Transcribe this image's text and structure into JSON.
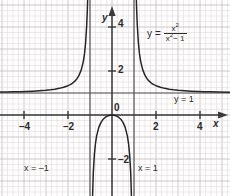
{
  "chart_data": {
    "type": "line",
    "title": "",
    "equation_label": "y = x²/(x² − 1)",
    "equation_parts": {
      "lhs": "y",
      "equals": "=",
      "numerator_base": "x",
      "numerator_exp": "2",
      "denominator_base": "x",
      "denominator_exp": "2",
      "denominator_tail": "− 1"
    },
    "xlabel": "x",
    "ylabel": "y",
    "xlim": [
      -5.1,
      5.4
    ],
    "ylim": [
      -3.6,
      4.9
    ],
    "x_ticks": [
      -4,
      -2,
      2,
      4
    ],
    "x_tick_labels": [
      "–4",
      "–2",
      "2",
      "4"
    ],
    "y_ticks": [
      2,
      4,
      -2
    ],
    "y_tick_labels": [
      "2",
      "4",
      "–2"
    ],
    "origin_label": "0",
    "grid": true,
    "grid_minor_spacing_units": 0.25,
    "grid_major_spacing_units": 1,
    "legend_position": "none",
    "asymptotes": [
      {
        "name": "vertical-left",
        "type": "vertical",
        "value": -1,
        "label": "x = –1"
      },
      {
        "name": "vertical-right",
        "type": "vertical",
        "value": 1,
        "label": "x = 1"
      },
      {
        "name": "horizontal",
        "type": "horizontal",
        "value": 1,
        "label": "y = 1"
      }
    ],
    "series": [
      {
        "name": "left-branch",
        "domain": [
          -5.1,
          -1.02
        ],
        "points": [
          [
            -5.1,
            1.0417
          ],
          [
            -4.8,
            1.0474
          ],
          [
            -4.5,
            1.0541
          ],
          [
            -4.2,
            1.06
          ],
          [
            -3.9,
            1.0701
          ],
          [
            -3.6,
            1.0833
          ],
          [
            -3.3,
            1.1013
          ],
          [
            -3.0,
            1.125
          ],
          [
            -2.8,
            1.1458
          ],
          [
            -2.6,
            1.1733
          ],
          [
            -2.4,
            1.2109
          ],
          [
            -2.2,
            1.2644
          ],
          [
            -2.0,
            1.3333
          ],
          [
            -1.9,
            1.3805
          ],
          [
            -1.8,
            1.4423
          ],
          [
            -1.7,
            1.5263
          ],
          [
            -1.6,
            1.641
          ],
          [
            -1.5,
            1.8
          ],
          [
            -1.4,
            2.0417
          ],
          [
            -1.3,
            2.4493
          ],
          [
            -1.25,
            2.7778
          ],
          [
            -1.2,
            3.2727
          ],
          [
            -1.15,
            4.0698
          ],
          [
            -1.12,
            4.8131
          ],
          [
            -1.1,
            5.4762
          ],
          [
            -1.05,
            10.2561
          ],
          [
            -1.02,
            25.7525
          ]
        ]
      },
      {
        "name": "middle-branch",
        "domain": [
          -0.98,
          0.98
        ],
        "points": [
          [
            -0.98,
            -24.2525
          ],
          [
            -0.95,
            -9.2564
          ],
          [
            -0.9,
            -4.2632
          ],
          [
            -0.85,
            -2.6081
          ],
          [
            -0.8,
            -1.7778
          ],
          [
            -0.75,
            -1.2857
          ],
          [
            -0.7,
            -0.9608
          ],
          [
            -0.6,
            -0.5625
          ],
          [
            -0.5,
            -0.3333
          ],
          [
            -0.4,
            -0.1905
          ],
          [
            -0.3,
            -0.0989
          ],
          [
            -0.2,
            -0.0417
          ],
          [
            -0.1,
            -0.0101
          ],
          [
            0.0,
            0.0
          ],
          [
            0.1,
            -0.0101
          ],
          [
            0.2,
            -0.0417
          ],
          [
            0.3,
            -0.0989
          ],
          [
            0.4,
            -0.1905
          ],
          [
            0.5,
            -0.3333
          ],
          [
            0.6,
            -0.5625
          ],
          [
            0.7,
            -0.9608
          ],
          [
            0.75,
            -1.2857
          ],
          [
            0.8,
            -1.7778
          ],
          [
            0.85,
            -2.6081
          ],
          [
            0.9,
            -4.2632
          ],
          [
            0.95,
            -9.2564
          ],
          [
            0.98,
            -24.2525
          ]
        ]
      },
      {
        "name": "right-branch",
        "domain": [
          1.02,
          5.4
        ],
        "points": [
          [
            1.02,
            25.7525
          ],
          [
            1.05,
            10.2561
          ],
          [
            1.1,
            5.4762
          ],
          [
            1.12,
            4.8131
          ],
          [
            1.15,
            4.0698
          ],
          [
            1.2,
            3.2727
          ],
          [
            1.25,
            2.7778
          ],
          [
            1.3,
            2.4493
          ],
          [
            1.4,
            2.0417
          ],
          [
            1.5,
            1.8
          ],
          [
            1.6,
            1.641
          ],
          [
            1.7,
            1.5263
          ],
          [
            1.8,
            1.4423
          ],
          [
            1.9,
            1.3805
          ],
          [
            2.0,
            1.3333
          ],
          [
            2.2,
            1.2644
          ],
          [
            2.4,
            1.2109
          ],
          [
            2.6,
            1.1733
          ],
          [
            2.8,
            1.1458
          ],
          [
            3.0,
            1.125
          ],
          [
            3.3,
            1.1013
          ],
          [
            3.6,
            1.0833
          ],
          [
            3.9,
            1.0701
          ],
          [
            4.2,
            1.06
          ],
          [
            4.5,
            1.0541
          ],
          [
            4.8,
            1.0474
          ],
          [
            5.4,
            1.036
          ]
        ]
      }
    ],
    "colors": {
      "curve": "#262626",
      "axis": "#3a3a3a",
      "asymptote": "#5a5a5a",
      "grid_minor": "#e8dede",
      "grid_major": "#cfc6c6",
      "text": "#2b2b2b",
      "background": "#ffffff"
    }
  },
  "labels": {
    "x_axis_name": "x",
    "y_axis_name": "y",
    "origin": "0",
    "tick_minus4": "–4",
    "tick_minus2": "–2",
    "tick_2": "2",
    "tick_4": "4",
    "tick_y2": "2",
    "tick_y4": "4",
    "tick_ymin2": "–2",
    "asym_left": "x = –1",
    "asym_right": "x = 1",
    "asym_horizontal": "y = 1"
  }
}
